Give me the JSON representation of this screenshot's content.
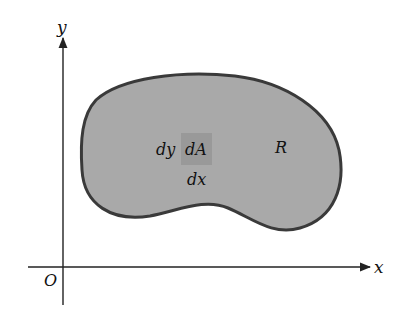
{
  "diagram": {
    "axes": {
      "x_label": "x",
      "y_label": "y",
      "origin_label": "O",
      "color": "#222222"
    },
    "region": {
      "label": "R",
      "fill": "#a9a9a9",
      "stroke": "#3a3a3a"
    },
    "area_element": {
      "label": "dA",
      "width_label": "dx",
      "height_label": "dy",
      "fill": "#999999"
    }
  }
}
